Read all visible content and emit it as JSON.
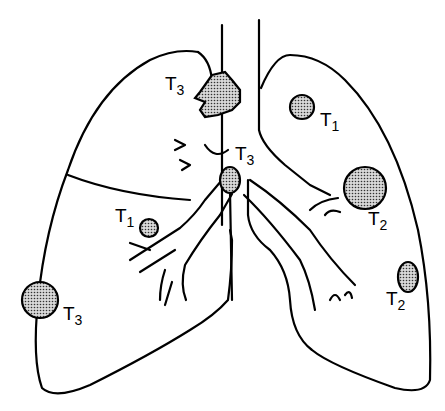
{
  "diagram": {
    "colors": {
      "line": "#000000",
      "background": "#ffffff",
      "tumor_fill_dots": "#555555"
    },
    "tumors": [
      {
        "id": "right-upper-apex",
        "stage": "T",
        "sub": "3",
        "shape": "irregular"
      },
      {
        "id": "hilum",
        "stage": "T",
        "sub": "3",
        "shape": "oval"
      },
      {
        "id": "right-middle",
        "stage": "T",
        "sub": "1",
        "shape": "circle"
      },
      {
        "id": "right-chest-wall",
        "stage": "T",
        "sub": "3",
        "shape": "circle"
      },
      {
        "id": "left-upper",
        "stage": "T",
        "sub": "1",
        "shape": "circle"
      },
      {
        "id": "left-hilar-large",
        "stage": "T",
        "sub": "2",
        "shape": "circle"
      },
      {
        "id": "left-lower-pleural",
        "stage": "T",
        "sub": "2",
        "shape": "oval"
      }
    ]
  }
}
